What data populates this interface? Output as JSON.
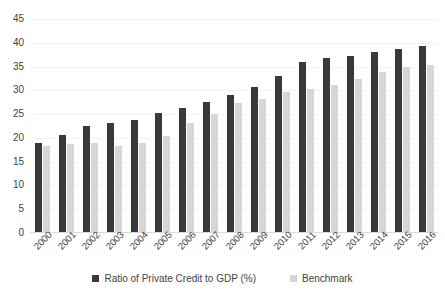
{
  "chart_data": {
    "type": "bar",
    "title": "",
    "subtitle": "",
    "xlabel": "",
    "ylabel": "",
    "ylim": [
      0,
      45
    ],
    "yticks": [
      0,
      5,
      10,
      15,
      20,
      25,
      30,
      35,
      40,
      45
    ],
    "grid": true,
    "legend_position": "bottom",
    "categories": [
      "2000",
      "2001",
      "2002",
      "2003",
      "2004",
      "2005",
      "2006",
      "2007",
      "2008",
      "2009",
      "2010",
      "2011",
      "2012",
      "2013",
      "2014",
      "2015",
      "2016"
    ],
    "series": [
      {
        "name": "Ratio of Private Credit to GDP (%)",
        "color": "#3a3a3a",
        "values": [
          19.0,
          20.6,
          22.6,
          23.1,
          23.8,
          25.2,
          26.3,
          27.6,
          29.0,
          30.8,
          33.0,
          36.0,
          36.8,
          37.3,
          38.0,
          38.6,
          39.4
        ]
      },
      {
        "name": "Benchmark",
        "color": "#d6d6d6",
        "values": [
          18.3,
          18.7,
          18.9,
          18.3,
          19.0,
          20.5,
          23.1,
          25.1,
          27.4,
          28.2,
          29.7,
          30.2,
          31.2,
          32.3,
          33.8,
          35.0,
          35.4
        ]
      }
    ]
  },
  "legend": {
    "items": [
      {
        "label": "Ratio of Private Credit to GDP (%)",
        "swatch": "primary"
      },
      {
        "label": "Benchmark",
        "swatch": "secondary"
      }
    ]
  }
}
